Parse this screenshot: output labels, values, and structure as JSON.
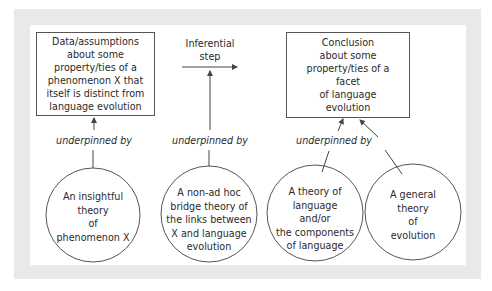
{
  "diagram": {
    "boxes": {
      "data": {
        "lines": [
          "Data/assumptions",
          "about some",
          "property/ties of a",
          "phenomenon X that",
          "itself is distinct from",
          "language evolution"
        ]
      },
      "conclusion": {
        "lines": [
          "Conclusion",
          "about some",
          "property/ties of a",
          "facet",
          "of language",
          "evolution"
        ]
      }
    },
    "inferential_step": {
      "lines": [
        "Inferential",
        "step"
      ]
    },
    "labels": {
      "underpinned_1": "underpinned by",
      "underpinned_2": "underpinned by",
      "underpinned_3": "underpinned by"
    },
    "circles": [
      {
        "lines": [
          "An insightful",
          "theory",
          "of",
          "phenomenon X"
        ]
      },
      {
        "lines": [
          "A non-ad hoc",
          "bridge theory of",
          "the links between",
          "X and language",
          "evolution"
        ]
      },
      {
        "lines": [
          "A theory of",
          "language",
          "and/or",
          "the components",
          "of language"
        ]
      },
      {
        "lines": [
          "A general",
          "theory",
          "of",
          "evolution"
        ]
      }
    ],
    "colors": {
      "frame": "#e9e9e9",
      "panel": "#ffffff",
      "stroke": "#555555",
      "text": "#2a2a2a"
    }
  }
}
